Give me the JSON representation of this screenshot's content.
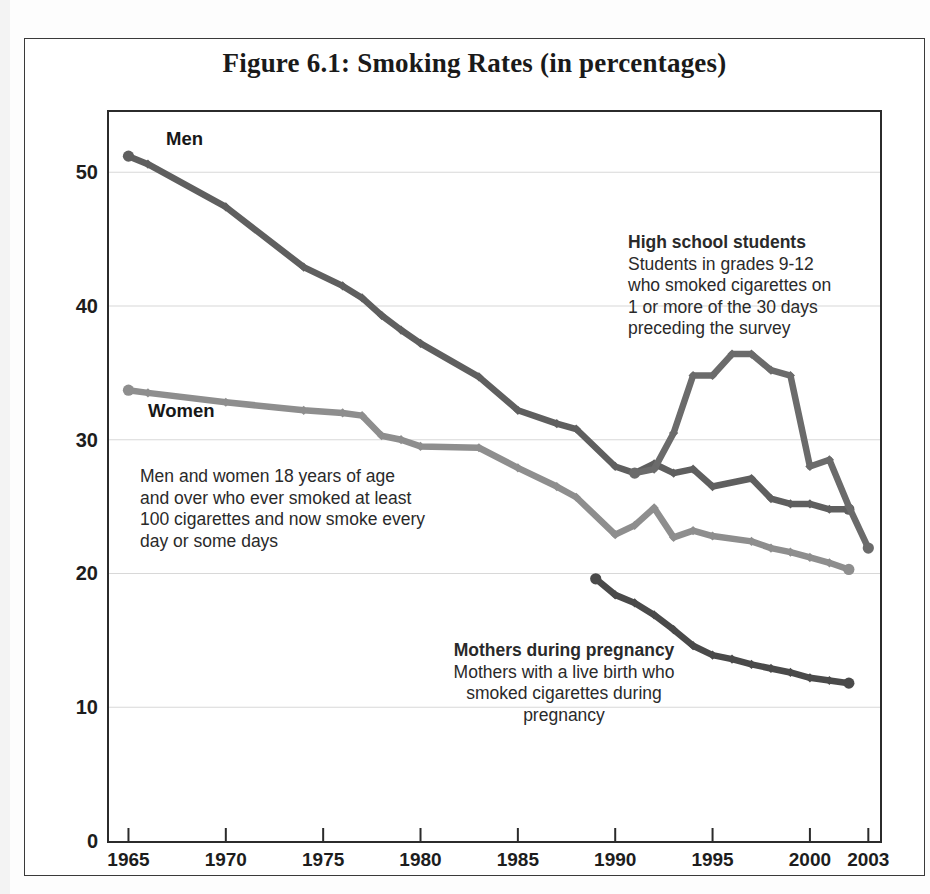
{
  "figure": {
    "title": "Figure 6.1: Smoking Rates (in percentages)"
  },
  "annotations": {
    "men_label": "Men",
    "women_label": "Women",
    "men_women_note": [
      "Men and women 18 years of age",
      "and over who ever smoked at least",
      "100 cigarettes and now smoke every",
      "day or some days"
    ],
    "high_school_heading": "High school students",
    "high_school_note": [
      "Students in grades 9-12",
      "who smoked cigarettes on",
      "1 or more of the 30 days",
      "preceding the survey"
    ],
    "mothers_heading": "Mothers during pregnancy",
    "mothers_note": [
      "Mothers with a live birth who",
      "smoked cigarettes during",
      "pregnancy"
    ]
  },
  "colors": {
    "men": "#5f5f5f",
    "women": "#8e8e8e",
    "high_school": "#6b6b6b",
    "mothers": "#4a4a4a",
    "axis": "#2b2b2b",
    "gridline": "#d8d8d8",
    "text": "#1d1d1d"
  },
  "chart_data": {
    "type": "line",
    "title": "Figure 6.1: Smoking Rates (in percentages)",
    "xlabel": "",
    "ylabel": "",
    "xlim": [
      1964,
      2003.6
    ],
    "ylim": [
      0,
      54.5
    ],
    "xticks": [
      1965,
      1970,
      1975,
      1980,
      1985,
      1990,
      1995,
      2000,
      2003
    ],
    "xticklabels": [
      "1965",
      "1970",
      "1975",
      "1980",
      "1985",
      "1990",
      "1995",
      "2000",
      "2003"
    ],
    "yticks": [
      0,
      10,
      20,
      30,
      40,
      50
    ],
    "yticklabels": [
      "0",
      "10",
      "20",
      "30",
      "40",
      "50"
    ],
    "grid": "horizontal",
    "legend": "inline-annotations",
    "series": [
      {
        "name": "Men",
        "color": "#5f5f5f",
        "x": [
          1965,
          1966,
          1970,
          1974,
          1976,
          1977,
          1978,
          1979,
          1980,
          1983,
          1985,
          1987,
          1988,
          1990,
          1991,
          1992,
          1993,
          1994,
          1995,
          1997,
          1998,
          1999,
          2000,
          2001,
          2002
        ],
        "y": [
          51.2,
          50.6,
          47.4,
          42.9,
          41.5,
          40.6,
          39.3,
          38.2,
          37.2,
          34.7,
          32.2,
          31.2,
          30.8,
          28.0,
          27.5,
          28.2,
          27.5,
          27.8,
          26.5,
          27.1,
          25.6,
          25.2,
          25.2,
          24.8,
          24.8
        ],
        "marker": "diamond"
      },
      {
        "name": "Women",
        "color": "#8e8e8e",
        "x": [
          1965,
          1966,
          1970,
          1974,
          1976,
          1977,
          1978,
          1979,
          1980,
          1983,
          1985,
          1987,
          1988,
          1990,
          1991,
          1992,
          1993,
          1994,
          1995,
          1997,
          1998,
          1999,
          2000,
          2001,
          2002
        ],
        "y": [
          33.7,
          33.5,
          32.8,
          32.2,
          32.0,
          31.8,
          30.3,
          30.0,
          29.5,
          29.4,
          27.9,
          26.5,
          25.7,
          22.9,
          23.6,
          24.9,
          22.7,
          23.2,
          22.8,
          22.4,
          21.9,
          21.6,
          21.2,
          20.8,
          20.3
        ],
        "marker": "diamond"
      },
      {
        "name": "High school students",
        "color": "#6b6b6b",
        "x": [
          1991,
          1992,
          1993,
          1994,
          1995,
          1996,
          1997,
          1998,
          1999,
          2000,
          2001,
          2002,
          2003
        ],
        "y": [
          27.5,
          27.8,
          30.5,
          34.8,
          34.8,
          36.4,
          36.4,
          35.2,
          34.8,
          28.0,
          28.5,
          25.0,
          21.9
        ],
        "marker": "diamond"
      },
      {
        "name": "Mothers during pregnancy",
        "color": "#4a4a4a",
        "x": [
          1989,
          1990,
          1991,
          1992,
          1993,
          1994,
          1995,
          1996,
          1997,
          1998,
          1999,
          2000,
          2001,
          2002
        ],
        "y": [
          19.6,
          18.4,
          17.8,
          16.9,
          15.8,
          14.6,
          13.9,
          13.6,
          13.2,
          12.9,
          12.6,
          12.2,
          12.0,
          11.8
        ],
        "marker": "diamond"
      }
    ]
  }
}
